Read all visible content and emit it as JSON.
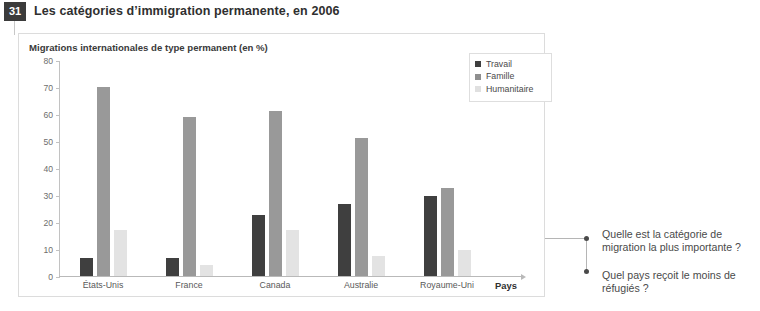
{
  "figure": {
    "number": "31",
    "title": "Les catégories d’immigration permanente, en 2006"
  },
  "chart_panel": {
    "subtitle": "Migrations internationales de type permanent (en %)"
  },
  "legend": {
    "items": [
      {
        "label": "Travail",
        "color": "#3f3f3f",
        "icon": "square-swatch-icon"
      },
      {
        "label": "Famille",
        "color": "#8f8f8f",
        "icon": "square-swatch-icon"
      },
      {
        "label": "Humanitaire",
        "color": "#e0e0e0",
        "icon": "square-swatch-icon"
      }
    ]
  },
  "questions": [
    {
      "bullet": "bullet-dot-icon",
      "text": "Quelle est la catégorie de migration la plus importante ?"
    },
    {
      "bullet": "bullet-dot-icon",
      "text": "Quel pays reçoit le moins de réfugiés ?"
    }
  ],
  "chart_data": {
    "type": "bar",
    "title": "Les catégories d’immigration permanente, en 2006",
    "subtitle": "Migrations internationales de type permanent (en %)",
    "xlabel": "Pays",
    "ylabel": "",
    "ylim": [
      0,
      80
    ],
    "yticks": [
      0,
      10,
      20,
      30,
      40,
      50,
      60,
      70,
      80
    ],
    "ytick_labels": [
      "0",
      "10",
      "20",
      "30",
      "40",
      "50",
      "60",
      "70",
      "80"
    ],
    "grid": false,
    "legend_position": "top-right",
    "categories": [
      "États-Unis",
      "France",
      "Canada",
      "Australie",
      "Royaume-Uni"
    ],
    "series": [
      {
        "name": "Travail",
        "color": "#3f3f3f",
        "values": [
          6.5,
          6.5,
          22.5,
          26.5,
          29.5
        ]
      },
      {
        "name": "Famille",
        "color": "#999999",
        "values": [
          70,
          59,
          61,
          51,
          32.5
        ]
      },
      {
        "name": "Humanitaire",
        "color": "#e3e3e3",
        "values": [
          17,
          4,
          17,
          7.5,
          9.5
        ]
      }
    ]
  }
}
